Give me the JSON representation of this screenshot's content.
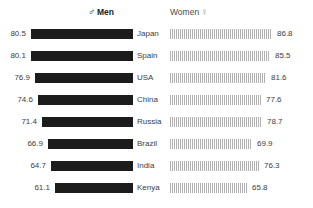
{
  "header": {
    "men_label": "Men",
    "men_symbol": "♂",
    "men_symbol_name": "male-gender-icon",
    "women_label": "Women",
    "women_symbol": "♀",
    "women_symbol_name": "female-gender-icon"
  },
  "style": {
    "men_bar_color": "#1c1c1c",
    "women_bar_color": "#b0b0b0",
    "background": "#ffffff",
    "text_color": "#3d3d3d"
  },
  "chart_data": {
    "type": "bar",
    "title": "",
    "xlabel": "",
    "ylabel": "",
    "orientation": "horizontal-diverging",
    "grid": false,
    "legend_position": "top",
    "categories": [
      "Japan",
      "Spain",
      "USA",
      "China",
      "Russia",
      "Brazil",
      "India",
      "Kenya"
    ],
    "series": [
      {
        "name": "Men",
        "side": "left",
        "values": [
          80.5,
          80.1,
          76.9,
          74.6,
          71.4,
          66.9,
          64.7,
          61.1
        ]
      },
      {
        "name": "Women",
        "side": "right",
        "values": [
          86.8,
          85.5,
          81.6,
          77.6,
          78.7,
          69.9,
          76.3,
          65.8
        ]
      }
    ],
    "value_labels": {
      "men": [
        "80.5",
        "80.1",
        "76.9",
        "74.6",
        "71.4",
        "66.9",
        "64.7",
        "61.1"
      ],
      "women": [
        "86.8",
        "85.5",
        "81.6",
        "77.6",
        "78.7",
        "69.9",
        "76.3",
        "65.8"
      ]
    },
    "xlim": [
      0,
      90
    ]
  }
}
